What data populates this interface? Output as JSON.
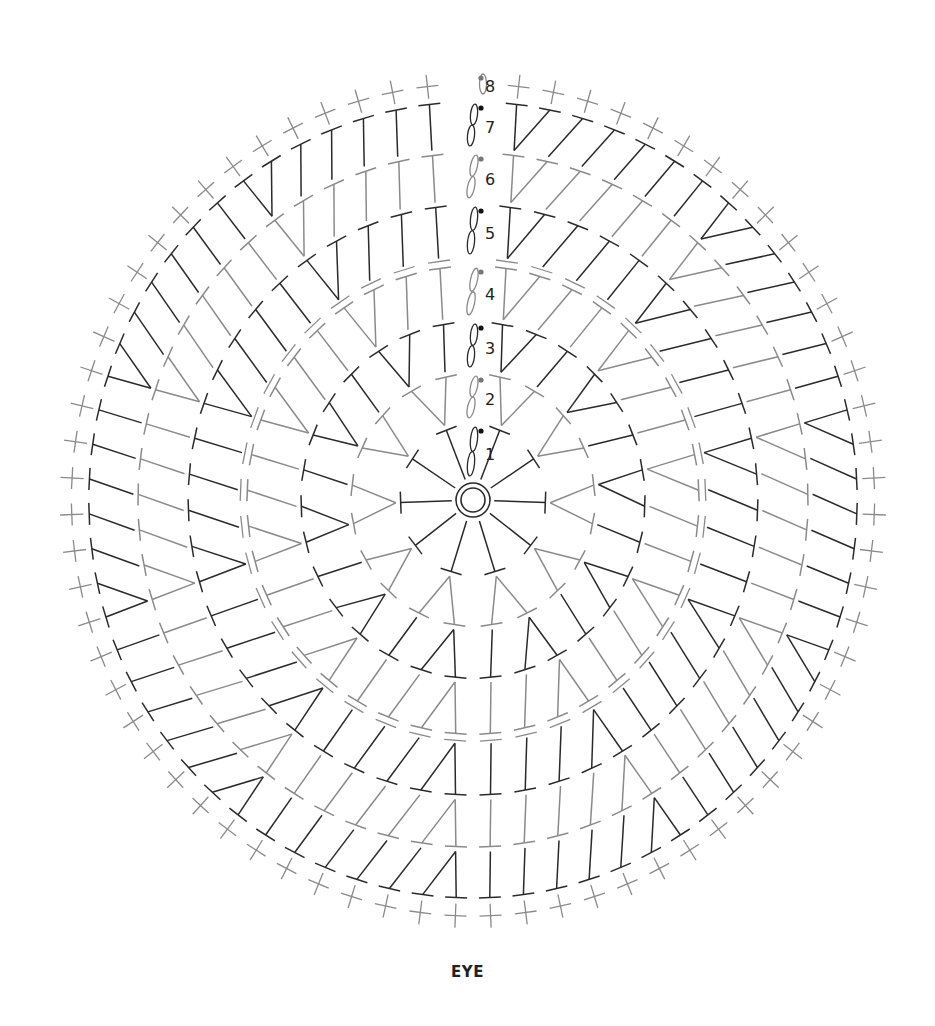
{
  "diagram": {
    "title": "EYE",
    "type": "crochet-round-chart",
    "colors": {
      "dark": "#2a2a2a",
      "gray": "#8a8a8a",
      "dot_dark": "#111111",
      "dot_gray": "#777777"
    },
    "center": {
      "x": 473,
      "y": 500,
      "sx": 0.965,
      "sy": 1.0
    },
    "magic_ring": {
      "r_outer": 17,
      "r_inner": 12
    },
    "rounds": [
      {
        "label": "1",
        "stitch": "hdc",
        "count": 10,
        "r_in": 22,
        "r_out": 75,
        "tone": "dark"
      },
      {
        "label": "2",
        "stitch": "hdc",
        "count": 20,
        "r_in": 80,
        "r_out": 126,
        "tone": "gray"
      },
      {
        "label": "3",
        "stitch": "hdc",
        "count": 30,
        "r_in": 131,
        "r_out": 178,
        "tone": "dark"
      },
      {
        "label": "4",
        "stitch": "dc",
        "count": 40,
        "r_in": 183,
        "r_out": 234,
        "tone": "gray"
      },
      {
        "label": "5",
        "stitch": "hdc",
        "count": 50,
        "r_in": 244,
        "r_out": 295,
        "tone": "dark"
      },
      {
        "label": "6",
        "stitch": "hdc",
        "count": 60,
        "r_in": 300,
        "r_out": 347,
        "tone": "gray"
      },
      {
        "label": "7",
        "stitch": "hdc",
        "count": 70,
        "r_in": 352,
        "r_out": 398,
        "tone": "dark"
      },
      {
        "label": "8",
        "stitch": "sc",
        "count": 70,
        "r_in": 404,
        "r_out": 428,
        "tone": "gray"
      }
    ],
    "start_chain": {
      "labels": [
        "1",
        "2",
        "3",
        "4",
        "5",
        "6",
        "7",
        "8"
      ],
      "dot_tones": [
        "dark",
        "gray",
        "dark",
        "gray",
        "dark",
        "gray",
        "dark",
        "gray"
      ]
    }
  }
}
